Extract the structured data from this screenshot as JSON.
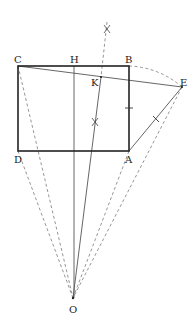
{
  "diagram": {
    "type": "geometry-construction",
    "colors": {
      "rect": "#222222",
      "solid_line": "#444444",
      "dashed_line": "#888888",
      "label": "#222222"
    },
    "points": {
      "C": {
        "label": "C",
        "x": 18,
        "y": 66
      },
      "H": {
        "label": "H",
        "x": 74,
        "y": 66
      },
      "B": {
        "label": "B",
        "x": 129,
        "y": 66
      },
      "K": {
        "label": "K",
        "x": 101,
        "y": 77
      },
      "E": {
        "label": "E",
        "x": 182,
        "y": 87
      },
      "D": {
        "label": "D",
        "x": 18,
        "y": 151
      },
      "A": {
        "label": "A",
        "x": 129,
        "y": 151
      },
      "O": {
        "label": "O",
        "x": 73,
        "y": 298
      }
    },
    "segments": [
      {
        "from": "C",
        "to": "B",
        "style": "solid-thick"
      },
      {
        "from": "B",
        "to": "A",
        "style": "solid-thick"
      },
      {
        "from": "A",
        "to": "D",
        "style": "solid-thick"
      },
      {
        "from": "D",
        "to": "C",
        "style": "solid-thick"
      },
      {
        "from": "C",
        "to": "E",
        "style": "solid"
      },
      {
        "from": "A",
        "to": "E",
        "style": "solid"
      },
      {
        "from": "H",
        "to": "O",
        "style": "solid"
      },
      {
        "from": "K",
        "to": "O",
        "style": "solid"
      },
      {
        "from": "C",
        "to": "O",
        "style": "dashed"
      },
      {
        "from": "D",
        "to": "O",
        "style": "dashed"
      },
      {
        "from": "A",
        "to": "O",
        "style": "dashed"
      },
      {
        "from": "E",
        "to": "O",
        "style": "dashed"
      }
    ],
    "arc": {
      "from": "B",
      "to": "E",
      "center": "A",
      "style": "dashed"
    },
    "marks": [
      {
        "type": "tick",
        "on": "BA"
      },
      {
        "type": "tick",
        "on": "AE"
      },
      {
        "type": "cross",
        "on": "perpendicular-bisector",
        "position": "upper"
      },
      {
        "type": "cross",
        "on": "perpendicular-bisector",
        "position": "lower"
      }
    ]
  }
}
